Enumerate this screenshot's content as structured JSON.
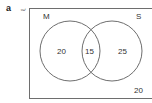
{
  "part_label": "a",
  "universal_symbol": "ξ",
  "sets": [
    {
      "name": "M"
    },
    {
      "name": "S"
    }
  ],
  "regions": {
    "m_only": "20",
    "intersection": "15",
    "s_only": "25",
    "outside": "20"
  },
  "colors": {
    "line": "#6e6e6e",
    "text": "#333333"
  }
}
